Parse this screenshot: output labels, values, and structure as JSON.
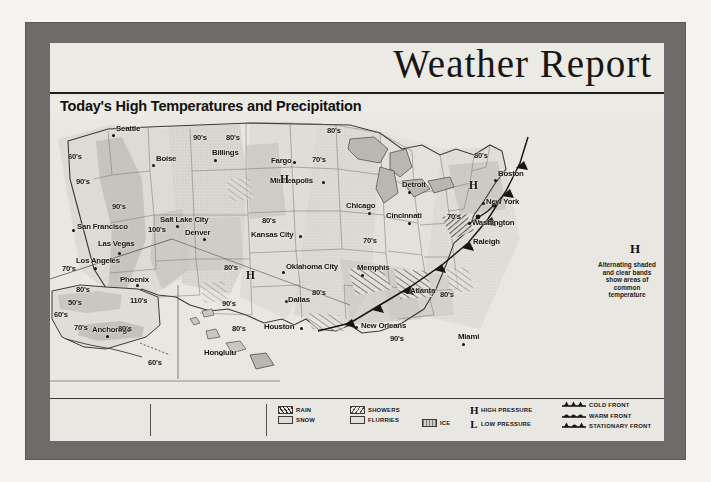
{
  "header": {
    "title": "Weather Report",
    "subtitle": "Today's High Temperatures and Precipitation",
    "map_time": "Map for 2 P.M.",
    "map_date": "July 27, 1994"
  },
  "side_note": {
    "pressure_symbol": "H",
    "text": "Alternating shaded and clear bands show areas of common temperature"
  },
  "legend": {
    "precipitation": [
      {
        "label": "RAIN",
        "swatch": "rain-swatch"
      },
      {
        "label": "SNOW",
        "swatch": "snow-swatch"
      },
      {
        "label": "SHOWERS",
        "swatch": "showers-swatch"
      },
      {
        "label": "FLURRIES",
        "swatch": "flurries-swatch"
      },
      {
        "label": "ICE",
        "swatch": "ice-swatch"
      }
    ],
    "pressure": [
      {
        "symbol": "H",
        "label": "HIGH PRESSURE"
      },
      {
        "symbol": "L",
        "label": "LOW PRESSURE"
      }
    ],
    "fronts": [
      {
        "label": "COLD FRONT",
        "icon": "cold-front-icon"
      },
      {
        "label": "WARM FRONT",
        "icon": "warm-front-icon"
      },
      {
        "label": "STATIONARY FRONT",
        "icon": "stationary-front-icon"
      }
    ]
  },
  "map": {
    "cities": [
      {
        "name": "Seattle",
        "x": 62,
        "y": 15,
        "dx": 4,
        "dy": -9
      },
      {
        "name": "Boise",
        "x": 102,
        "y": 45,
        "dx": 4,
        "dy": -9
      },
      {
        "name": "Billings",
        "x": 164,
        "y": 40,
        "dx": -2,
        "dy": -10
      },
      {
        "name": "Fargo",
        "x": 243,
        "y": 42,
        "dx": -22,
        "dy": -4
      },
      {
        "name": "Minneapolis",
        "x": 272,
        "y": 62,
        "dx": -52,
        "dy": -4
      },
      {
        "name": "Detroit",
        "x": 358,
        "y": 72,
        "dx": -6,
        "dy": -10
      },
      {
        "name": "Chicago",
        "x": 318,
        "y": 93,
        "dx": -22,
        "dy": -10
      },
      {
        "name": "Cincinnati",
        "x": 358,
        "y": 103,
        "dx": -22,
        "dy": -10
      },
      {
        "name": "Boston",
        "x": 444,
        "y": 60,
        "dx": 4,
        "dy": -9
      },
      {
        "name": "New York",
        "x": 432,
        "y": 83,
        "dx": 4,
        "dy": -4
      },
      {
        "name": "Washington",
        "x": 418,
        "y": 103,
        "dx": 4,
        "dy": -3
      },
      {
        "name": "Raleigh",
        "x": 420,
        "y": 128,
        "dx": 3,
        "dy": -9
      },
      {
        "name": "San Francisco",
        "x": 22,
        "y": 110,
        "dx": 5,
        "dy": -6
      },
      {
        "name": "Salt Lake City",
        "x": 126,
        "y": 106,
        "dx": -16,
        "dy": -9
      },
      {
        "name": "Las Vegas",
        "x": 68,
        "y": 133,
        "dx": -20,
        "dy": -12
      },
      {
        "name": "Los Angeles",
        "x": 44,
        "y": 148,
        "dx": -18,
        "dy": -10
      },
      {
        "name": "Phoenix",
        "x": 86,
        "y": 165,
        "dx": -16,
        "dy": -8
      },
      {
        "name": "Denver",
        "x": 153,
        "y": 119,
        "dx": -18,
        "dy": -9
      },
      {
        "name": "Kansas City",
        "x": 249,
        "y": 116,
        "dx": -48,
        "dy": -4
      },
      {
        "name": "Oklahoma City",
        "x": 232,
        "y": 152,
        "dx": 4,
        "dy": -8
      },
      {
        "name": "Dallas",
        "x": 235,
        "y": 181,
        "dx": 3,
        "dy": -4
      },
      {
        "name": "Houston",
        "x": 250,
        "y": 208,
        "dx": -36,
        "dy": -4
      },
      {
        "name": "Memphis",
        "x": 311,
        "y": 155,
        "dx": -4,
        "dy": -10
      },
      {
        "name": "Atlanta",
        "x": 356,
        "y": 172,
        "dx": 4,
        "dy": -4
      },
      {
        "name": "New Orleans",
        "x": 305,
        "y": 207,
        "dx": 6,
        "dy": -4
      },
      {
        "name": "Miami",
        "x": 412,
        "y": 224,
        "dx": -4,
        "dy": -10
      },
      {
        "name": "Anchorage",
        "x": 56,
        "y": 216,
        "dx": -14,
        "dy": -9
      },
      {
        "name": "Honolulu",
        "x": 170,
        "y": 234,
        "dx": -16,
        "dy": -4
      }
    ],
    "temperatures": [
      {
        "value": "60's",
        "x": 18,
        "y": 34
      },
      {
        "value": "90's",
        "x": 26,
        "y": 59
      },
      {
        "value": "90's",
        "x": 62,
        "y": 84
      },
      {
        "value": "90's",
        "x": 143,
        "y": 15
      },
      {
        "value": "80's",
        "x": 277,
        "y": 8
      },
      {
        "value": "70's",
        "x": 262,
        "y": 37
      },
      {
        "value": "80's",
        "x": 176,
        "y": 15
      },
      {
        "value": "100's",
        "x": 98,
        "y": 107
      },
      {
        "value": "70's",
        "x": 12,
        "y": 146
      },
      {
        "value": "80's",
        "x": 26,
        "y": 167
      },
      {
        "value": "110's",
        "x": 80,
        "y": 178
      },
      {
        "value": "80's",
        "x": 212,
        "y": 98
      },
      {
        "value": "70's",
        "x": 313,
        "y": 118
      },
      {
        "value": "70's",
        "x": 397,
        "y": 94
      },
      {
        "value": "80's",
        "x": 424,
        "y": 33
      },
      {
        "value": "80's",
        "x": 174,
        "y": 145
      },
      {
        "value": "80's",
        "x": 262,
        "y": 170
      },
      {
        "value": "90's",
        "x": 172,
        "y": 181
      },
      {
        "value": "90's",
        "x": 340,
        "y": 216
      },
      {
        "value": "80's",
        "x": 390,
        "y": 172
      },
      {
        "value": "50's",
        "x": 18,
        "y": 180
      },
      {
        "value": "60's",
        "x": 4,
        "y": 192
      },
      {
        "value": "70's",
        "x": 24,
        "y": 205
      },
      {
        "value": "80's",
        "x": 68,
        "y": 206
      },
      {
        "value": "60's",
        "x": 98,
        "y": 240
      },
      {
        "value": "80's",
        "x": 182,
        "y": 206
      }
    ],
    "pressure_centers": [
      {
        "symbol": "H",
        "x": 230,
        "y": 56
      },
      {
        "symbol": "H",
        "x": 196,
        "y": 152
      },
      {
        "symbol": "H",
        "x": 419,
        "y": 62
      }
    ]
  }
}
